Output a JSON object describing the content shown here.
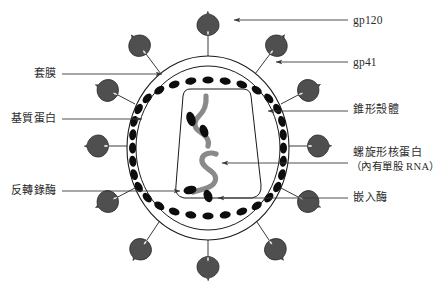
{
  "diagram": {
    "colors": {
      "background": "#ffffff",
      "outline": "#1a1a1a",
      "spike_fill": "#4f4f4f",
      "matrix_bead": "#0d0d0d",
      "rna_strand": "#8a8a8a",
      "enzyme": "#0d0d0d",
      "leader_line": "#3a3a3a",
      "text": "#2b2b2b"
    },
    "parts": {
      "envelope_outer_ring": "outer-envelope-ring",
      "matrix_ring": "matrix-protein-bead-ring",
      "capsid": "conical-capsid-shell",
      "rna_strands": "helical-nucleoprotein-rna-strands",
      "enzymes": "enzyme-ovals",
      "spikes": "glycoprotein-spikes"
    },
    "spike_count": 12
  },
  "labels": {
    "right": [
      {
        "id": "gp120",
        "text": "gp120",
        "script": "latin"
      },
      {
        "id": "gp41",
        "text": "gp41",
        "script": "latin"
      },
      {
        "id": "capsid",
        "text": "錐形殼體",
        "script": "cjk"
      },
      {
        "id": "nucleoprotein",
        "text": "螺旋形核蛋白",
        "script": "cjk"
      },
      {
        "id": "nucleoprotein_sub",
        "text": "（內有單股 RNA）",
        "script": "cjk"
      },
      {
        "id": "integrase",
        "text": "嵌入酶",
        "script": "cjk"
      }
    ],
    "left": [
      {
        "id": "envelope",
        "text": "套膜",
        "script": "cjk"
      },
      {
        "id": "matrix",
        "text": "基質蛋白",
        "script": "cjk"
      },
      {
        "id": "reverse_transcriptase",
        "text": "反轉錄酶",
        "script": "cjk"
      }
    ]
  }
}
